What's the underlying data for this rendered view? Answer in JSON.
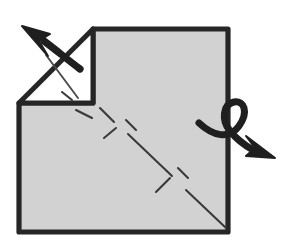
{
  "figure": {
    "title": "Origami fold step diagram",
    "description": "Hand-drawn square sheet of paper with a notched top-left corner, an unfold arrow pointing up-left, dashed diagonal crease lines, and a looping turn-over arrow at the right edge.",
    "canvas": {
      "width": 286,
      "height": 243
    },
    "background_color": "#ffffff"
  },
  "colors": {
    "paper_fill": "#d2d2d2",
    "flap_fill": "#ffffff",
    "outline": "#262626",
    "crease": "#3a3a3a",
    "arrow": "#1f1f1f"
  },
  "shapes": {
    "paper": {
      "name": "notched-square-sheet",
      "points": "93,29 228,29 228,232 19,232 19,103 93,103",
      "fill": "#d2d2d2",
      "stroke_width": 5.2
    },
    "flap": {
      "name": "unfolded-corner-flap",
      "points": "93,29 93,103 19,103",
      "fill": "#ffffff",
      "stroke_width": 5.0,
      "note": "white triangular flap lifted away from the top-left corner"
    }
  },
  "creases": [
    {
      "name": "flap-inner-crease",
      "x1": 46,
      "y1": 55,
      "x2": 78,
      "y2": 98
    },
    {
      "name": "crease-dash-1",
      "x1": 76,
      "y1": 110,
      "x2": 92,
      "y2": 118
    },
    {
      "name": "crease-dash-2",
      "x1": 100,
      "y1": 108,
      "x2": 114,
      "y2": 122
    },
    {
      "name": "crease-dash-3",
      "x1": 104,
      "y1": 138,
      "x2": 116,
      "y2": 128
    },
    {
      "name": "crease-dash-4",
      "x1": 126,
      "y1": 120,
      "x2": 136,
      "y2": 130
    },
    {
      "name": "crease-dash-5",
      "x1": 128,
      "y1": 134,
      "x2": 172,
      "y2": 176
    },
    {
      "name": "crease-dash-6",
      "x1": 156,
      "y1": 192,
      "x2": 170,
      "y2": 178
    },
    {
      "name": "crease-dash-7",
      "x1": 178,
      "y1": 168,
      "x2": 188,
      "y2": 178
    },
    {
      "name": "crease-dash-8",
      "x1": 186,
      "y1": 190,
      "x2": 226,
      "y2": 228
    },
    {
      "name": "crease-dash-9",
      "x1": 62,
      "y1": 92,
      "x2": 72,
      "y2": 100
    }
  ],
  "arrows": [
    {
      "name": "unfold-arrow-up-left",
      "type": "straight",
      "direction": "up-left",
      "meaning": "unfold the corner flap outward",
      "tail_path": "M 80,69 C 68,60 56,50 44,41",
      "head_points": "22,26 50,34 39,41 48,56",
      "stroke_width": 7.2
    },
    {
      "name": "turn-over-loop-arrow",
      "type": "looped",
      "direction": "right-down",
      "meaning": "turn the model over / rotate",
      "loop_path": "M 199,123 C 213,136 229,140 239,126 C 249,112 244,100 234,102 C 223,104 221,120 230,131 C 238,141 246,146 253,150",
      "head_points": "275,158 246,156 255,148 246,136",
      "stroke_width": 7.0
    }
  ],
  "labels": {
    "figure_alt": "Origami diagram: square with folded corner, unfold arrow and turn-over arrow"
  }
}
